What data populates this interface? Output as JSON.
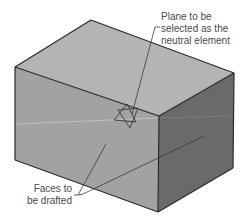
{
  "figure": {
    "colors": {
      "background": "#ffffff",
      "top_face": "#b4b4b4",
      "left_face": "#a2a2a2",
      "right_face": "#6a6a6a",
      "edge": "#2a2a2a",
      "leader": "#3a3a3a",
      "text": "#4a4a4a"
    },
    "callouts": {
      "plane": {
        "lines": [
          "Plane to be",
          "selected as the",
          "neutral element"
        ]
      },
      "faces": {
        "lines": [
          "Faces to",
          "be drafted"
        ]
      }
    },
    "neutral_element_icon": "star-of-david-plane-icon"
  }
}
